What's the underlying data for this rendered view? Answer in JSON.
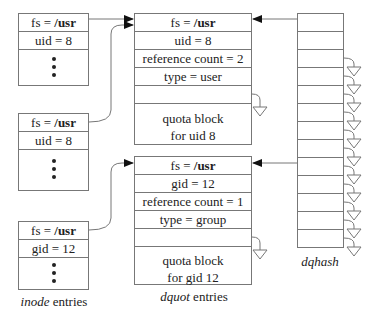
{
  "inode_entries": {
    "caption_italic": "inode",
    "caption_rest": " entries",
    "items": [
      {
        "fs_label": "fs = ",
        "fs_value": "/usr",
        "id_text": "uid = 8"
      },
      {
        "fs_label": "fs = ",
        "fs_value": "/usr",
        "id_text": "uid = 8"
      },
      {
        "fs_label": "fs = ",
        "fs_value": "/usr",
        "id_text": "gid = 12"
      }
    ]
  },
  "dquot_entries": {
    "caption_italic": "dquot",
    "caption_rest": " entries",
    "items": [
      {
        "fs_label": "fs = ",
        "fs_value": "/usr",
        "id_text": "uid = 8",
        "refcount": "reference count = 2",
        "type": "type = user",
        "quota_line1": "quota block",
        "quota_line2": "for uid 8"
      },
      {
        "fs_label": "fs = ",
        "fs_value": "/usr",
        "id_text": "gid = 12",
        "refcount": "reference count = 1",
        "type": "type = group",
        "quota_line1": "quota block",
        "quota_line2": "for gid 12"
      }
    ]
  },
  "dqhash": {
    "caption": "dqhash",
    "bucket_count": 13
  },
  "colors": {
    "line": "#777777",
    "arrow": "#111111",
    "text": "#222222"
  }
}
